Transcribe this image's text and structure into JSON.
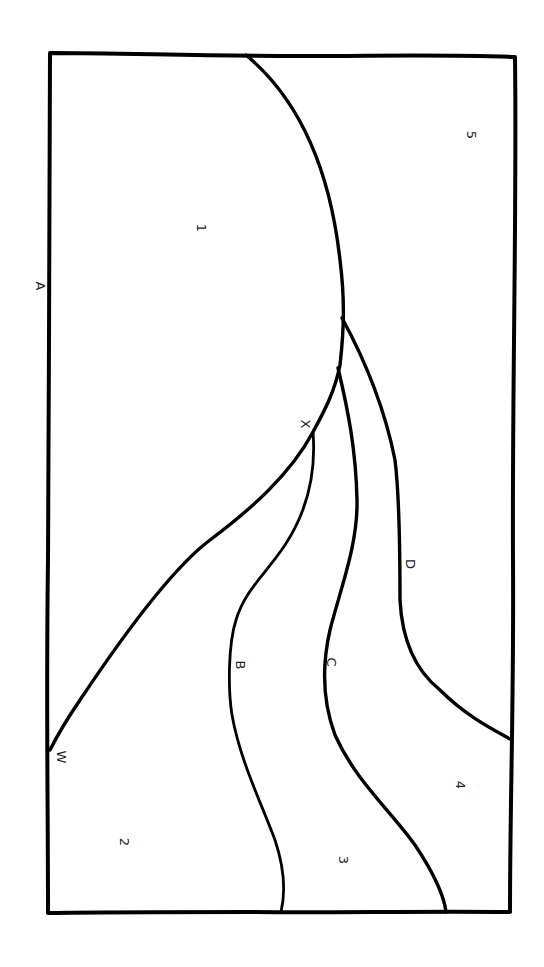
{
  "diagram": {
    "orientation": "rotated-90-clockwise",
    "line_color": "#000000",
    "background": "#ffffff",
    "boundary_labels": {
      "A": "A",
      "B": "B",
      "C": "C",
      "D": "D",
      "X": "X",
      "W": "W"
    },
    "region_labels": {
      "r1": "1",
      "r2": "2",
      "r3": "3",
      "r4": "4",
      "r5": "5"
    },
    "boundaries": [
      {
        "id": "A",
        "description": "Left edge of the outer frame"
      },
      {
        "id": "main-arc",
        "description": "Large arc from top edge through X to W on the left edge, enclosing region 1"
      },
      {
        "id": "B",
        "description": "Curve branching from the main arc at X down to the bottom edge"
      },
      {
        "id": "C",
        "description": "Curve branching from the main arc down to the bottom edge"
      },
      {
        "id": "D",
        "description": "Curve branching from the main arc to the right edge"
      }
    ],
    "regions": [
      {
        "id": "1",
        "bounded_by": [
          "A",
          "top edge",
          "main-arc"
        ]
      },
      {
        "id": "2",
        "bounded_by": [
          "A",
          "main-arc",
          "B",
          "bottom edge"
        ]
      },
      {
        "id": "3",
        "bounded_by": [
          "B",
          "C",
          "bottom edge"
        ]
      },
      {
        "id": "4",
        "bounded_by": [
          "C",
          "D",
          "right edge",
          "bottom edge"
        ]
      },
      {
        "id": "5",
        "bounded_by": [
          "top edge",
          "main-arc",
          "D",
          "right edge"
        ]
      }
    ]
  }
}
